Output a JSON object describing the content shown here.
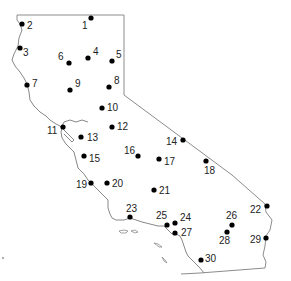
{
  "map": {
    "region": "California",
    "colors": {
      "outline": "#8c8c8c",
      "site": "#000000",
      "label": "#222222",
      "background": "#ffffff"
    },
    "sites": [
      {
        "id": "1",
        "label": "1"
      },
      {
        "id": "2",
        "label": "2"
      },
      {
        "id": "3",
        "label": "3"
      },
      {
        "id": "4",
        "label": "4"
      },
      {
        "id": "5",
        "label": "5"
      },
      {
        "id": "6",
        "label": "6"
      },
      {
        "id": "7",
        "label": "7"
      },
      {
        "id": "8",
        "label": "8"
      },
      {
        "id": "9",
        "label": "9"
      },
      {
        "id": "10",
        "label": "10"
      },
      {
        "id": "11",
        "label": "11"
      },
      {
        "id": "12",
        "label": "12"
      },
      {
        "id": "13",
        "label": "13"
      },
      {
        "id": "14",
        "label": "14"
      },
      {
        "id": "15",
        "label": "15"
      },
      {
        "id": "16",
        "label": "16"
      },
      {
        "id": "17",
        "label": "17"
      },
      {
        "id": "18",
        "label": "18"
      },
      {
        "id": "19",
        "label": "19"
      },
      {
        "id": "20",
        "label": "20"
      },
      {
        "id": "21",
        "label": "21"
      },
      {
        "id": "22",
        "label": "22"
      },
      {
        "id": "23",
        "label": "23"
      },
      {
        "id": "24",
        "label": "24"
      },
      {
        "id": "25",
        "label": "25"
      },
      {
        "id": "26",
        "label": "26"
      },
      {
        "id": "27",
        "label": "27"
      },
      {
        "id": "28",
        "label": "28"
      },
      {
        "id": "29",
        "label": "29"
      },
      {
        "id": "30",
        "label": "30"
      }
    ]
  }
}
